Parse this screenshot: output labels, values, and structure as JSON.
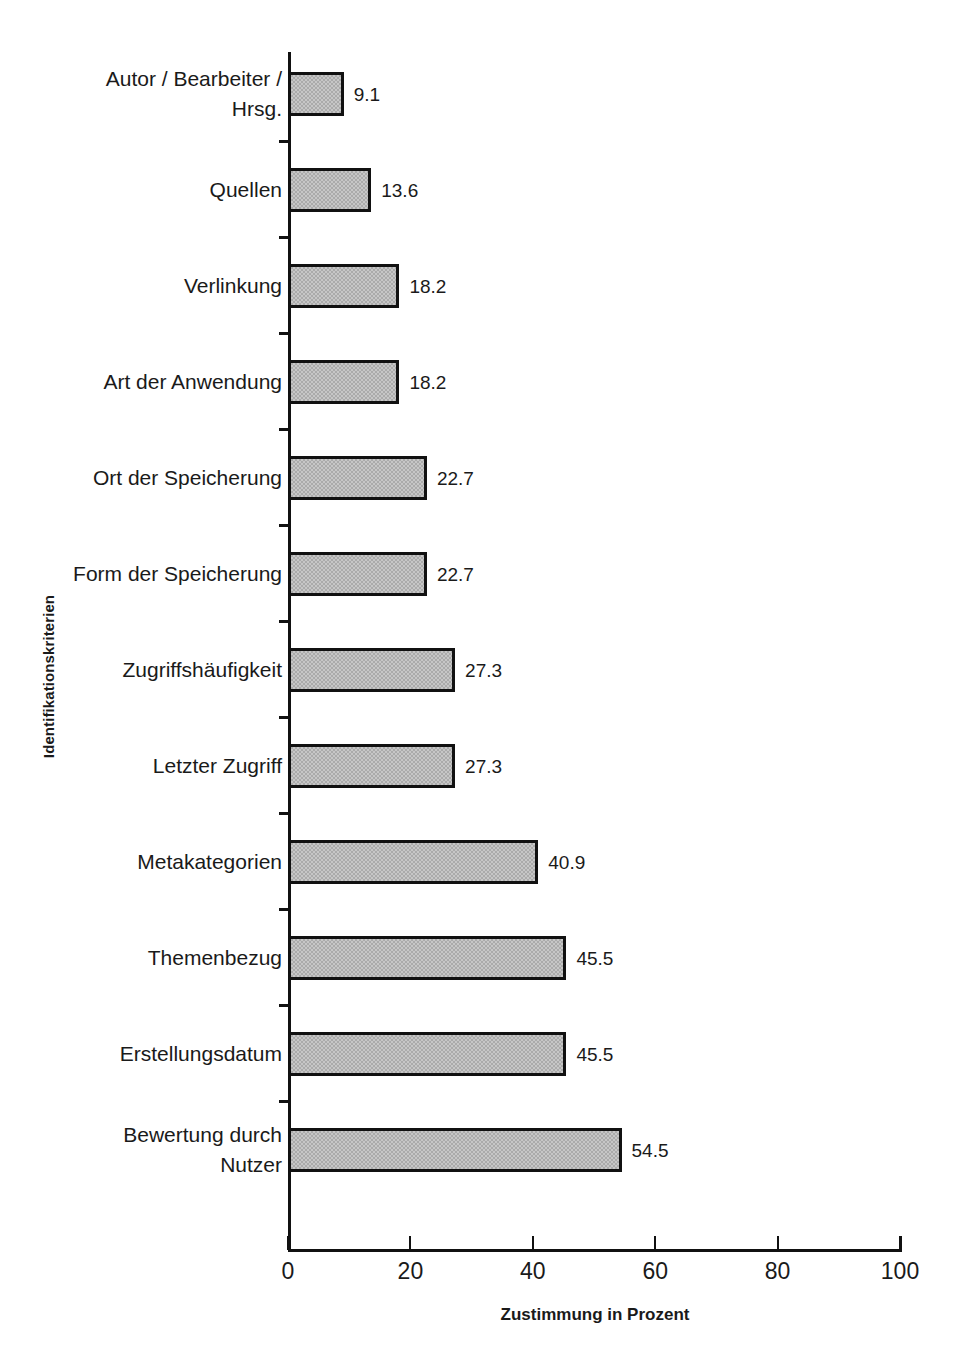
{
  "top_caption": "",
  "chart_data": {
    "type": "bar",
    "orientation": "horizontal",
    "title": "",
    "xlabel": "Zustimmung in Prozent",
    "ylabel": "Identifikationskriterien",
    "xlim": [
      0,
      100
    ],
    "xticks": [
      "0",
      "20",
      "40",
      "60",
      "80",
      "100"
    ],
    "grid": false,
    "legend": null,
    "data_labels": true,
    "categories": [
      "Autor / Bearbeiter / Hrsg.",
      "Quellen",
      "Verlinkung",
      "Art der Anwendung",
      "Ort der Speicherung",
      "Form der Speicherung",
      "Zugriffshäufigkeit",
      "Letzter Zugriff",
      "Metakategorien",
      "Themenbezug",
      "Erstellungsdatum",
      "Bewertung durch Nutzer"
    ],
    "values": [
      9.1,
      13.6,
      18.2,
      18.2,
      22.7,
      22.7,
      27.3,
      27.3,
      40.9,
      45.5,
      45.5,
      54.5
    ],
    "value_labels": [
      "9.1",
      "13.6",
      "18.2",
      "18.2",
      "22.7",
      "22.7",
      "27.3",
      "27.3",
      "40.9",
      "45.5",
      "45.5",
      "54.5"
    ],
    "category_lines": [
      [
        "Autor / Bearbeiter /",
        "Hrsg."
      ],
      [
        "Quellen"
      ],
      [
        "Verlinkung"
      ],
      [
        "Art der Anwendung"
      ],
      [
        "Ort der Speicherung"
      ],
      [
        "Form der Speicherung"
      ],
      [
        "Zugriffshäufigkeit"
      ],
      [
        "Letzter Zugriff"
      ],
      [
        "Metakategorien"
      ],
      [
        "Themenbezug"
      ],
      [
        "Erstellungsdatum"
      ],
      [
        "Bewertung durch",
        "Nutzer"
      ]
    ],
    "colors": {
      "bar_fill": "#ababab",
      "bar_border": "#111111",
      "axis": "#111111",
      "text": "#1a1a1a",
      "background": "#ffffff"
    }
  }
}
